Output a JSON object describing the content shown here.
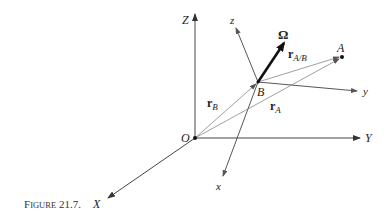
{
  "caption": {
    "prefix": "F",
    "smallcaps": "IGURE",
    "number": "21.7."
  },
  "labels": {
    "Z": "Z",
    "Y": "Y",
    "X": "X",
    "O": "O",
    "z": "z",
    "y": "y",
    "x": "x",
    "B": "B",
    "A": "A",
    "omega": "Ω",
    "rB_main": "r",
    "rB_sub": "B",
    "rA_main": "r",
    "rA_sub": "A",
    "rAB_main": "r",
    "rAB_sub": "A/B"
  },
  "points": {
    "O": [
      195,
      138
    ],
    "B": [
      258,
      82
    ],
    "A": [
      342,
      57
    ]
  },
  "colors": {
    "axis": "#333333",
    "thin": "#777777",
    "text": "#222222"
  }
}
